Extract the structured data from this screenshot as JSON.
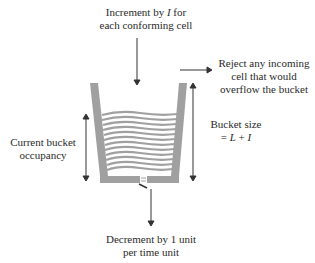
{
  "labels": {
    "increment_line1_pre": "Increment by ",
    "increment_var": "I",
    "increment_line1_post": " for",
    "increment_line2": "each conforming cell",
    "reject_line1": "Reject any incoming",
    "reject_line2": "cell that would",
    "reject_line3": "overflow the bucket",
    "occupancy_line1": "Current bucket",
    "occupancy_line2": "occupancy",
    "size_line1": "Bucket size",
    "size_eq": "= ",
    "size_L": "L",
    "size_plus": " + ",
    "size_I": "I",
    "decrement_line1": "Decrement by 1 unit",
    "decrement_line2": "per time unit"
  },
  "colors": {
    "bucket": "#a0a0a0",
    "arrow": "#333333",
    "text": "#2a2a2a"
  }
}
